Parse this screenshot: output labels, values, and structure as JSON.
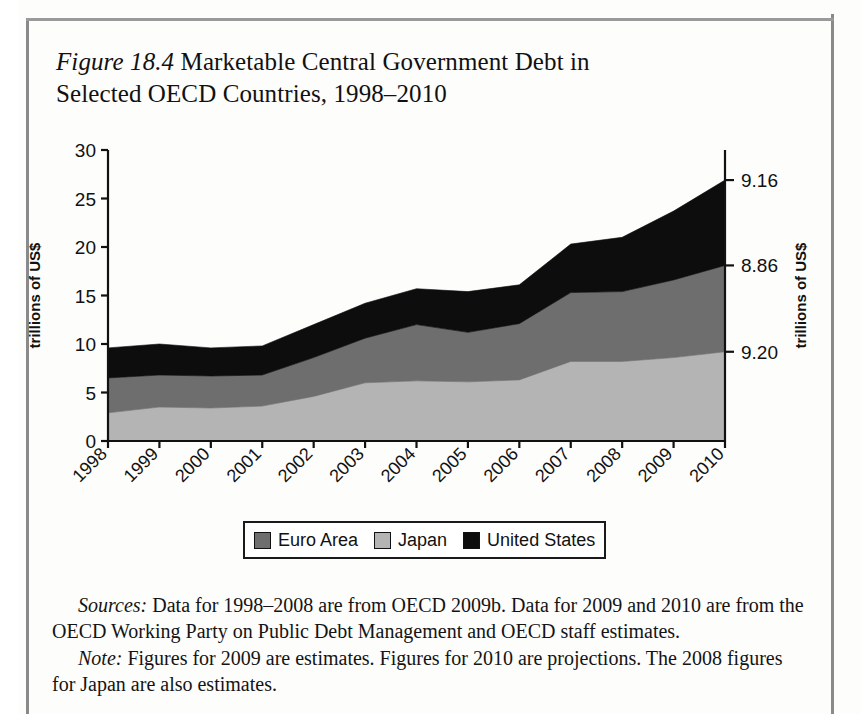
{
  "figure": {
    "number": "Figure 18.4",
    "title": " Marketable Central Government Debt in Selected OECD Countries, 1998–2010"
  },
  "legend": {
    "items": [
      {
        "label": "Euro Area",
        "color": "#6e6e6e"
      },
      {
        "label": "Japan",
        "color": "#b4b4b4"
      },
      {
        "label": "United States",
        "color": "#0d0d0d"
      }
    ]
  },
  "notes": {
    "sources_label": "Sources:",
    "sources_text": " Data for 1998–2008 are from OECD 2009b. Data for 2009 and 2010 are from the OECD Working Party on Public Debt Management and OECD staff estimates.",
    "note_label": "Note:",
    "note_text": " Figures for 2009 are estimates. Figures for 2010 are projections. The 2008 figures for Japan are also estimates."
  },
  "chart_data": {
    "type": "area",
    "stacked": true,
    "title": "Marketable Central Government Debt in Selected OECD Countries, 1998–2010",
    "xlabel": "",
    "ylabel": "trillions of US$",
    "ylabel_right": "trillions of US$",
    "categories": [
      "1998",
      "1999",
      "2000",
      "2001",
      "2002",
      "2003",
      "2004",
      "2005",
      "2006",
      "2007",
      "2008",
      "2009",
      "2010"
    ],
    "ylim": [
      0,
      30
    ],
    "yticks": [
      0,
      5,
      10,
      15,
      20,
      25,
      30
    ],
    "ytick_labels": [
      "0",
      "5",
      "10",
      "15",
      "20",
      "25",
      "30"
    ],
    "right_axis_labels": [
      {
        "text": "9.16",
        "value": 26.9,
        "series": "United States"
      },
      {
        "text": "8.86",
        "value": 18.1,
        "series": "Euro Area"
      },
      {
        "text": "9.20",
        "value": 9.2,
        "series": "Japan"
      }
    ],
    "grid": false,
    "legend_position": "bottom",
    "series": [
      {
        "name": "Japan",
        "color": "#b4b4b4",
        "values": [
          2.9,
          3.5,
          3.4,
          3.6,
          4.6,
          6.0,
          6.2,
          6.1,
          6.3,
          8.2,
          8.2,
          8.6,
          9.2
        ]
      },
      {
        "name": "Euro Area",
        "color": "#6e6e6e",
        "values": [
          3.6,
          3.3,
          3.3,
          3.2,
          4.0,
          4.6,
          5.8,
          5.1,
          5.8,
          7.1,
          7.2,
          8.0,
          8.9
        ]
      },
      {
        "name": "United States",
        "color": "#0d0d0d",
        "values": [
          3.1,
          3.2,
          2.9,
          3.0,
          3.4,
          3.6,
          3.7,
          4.2,
          4.0,
          5.0,
          5.6,
          7.1,
          8.8
        ]
      }
    ],
    "totals": [
      9.6,
      10.0,
      9.6,
      9.8,
      12.0,
      14.2,
      15.7,
      15.4,
      16.1,
      20.3,
      21.0,
      23.7,
      26.9
    ]
  }
}
